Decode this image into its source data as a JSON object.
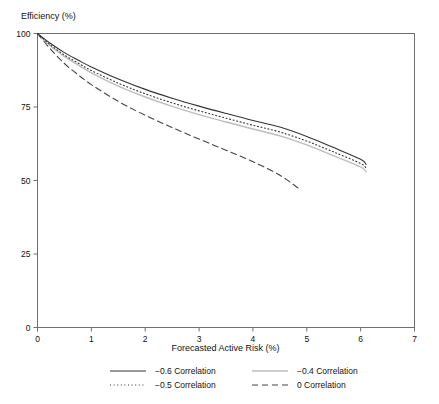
{
  "chart_data": {
    "type": "line",
    "title": "",
    "ylabel": "Efficiency (%)",
    "xlabel": "Forecasted Active Risk (%)",
    "xlim": [
      0,
      7
    ],
    "ylim": [
      0,
      100
    ],
    "xticks": [
      "0",
      "1",
      "2",
      "3",
      "4",
      "5",
      "6",
      "7"
    ],
    "yticks": [
      "0",
      "25",
      "50",
      "75",
      "100"
    ],
    "grid": false,
    "legend_position": "bottom",
    "series": [
      {
        "name": "-0.6 Correlation",
        "legend_label": "−0.6 Correlation",
        "style": "solid",
        "color": "#333333",
        "width": 1.1,
        "dash": "none",
        "x": [
          0,
          0.25,
          0.5,
          0.75,
          1,
          1.5,
          2,
          2.5,
          3,
          3.5,
          4,
          4.5,
          5,
          5.5,
          6,
          6.1
        ],
        "y": [
          100,
          96.5,
          93.5,
          91,
          88.6,
          84.5,
          81,
          78,
          75.3,
          72.8,
          70.4,
          68.2,
          65,
          61.2,
          57.2,
          55.5
        ]
      },
      {
        "name": "-0.5 Correlation",
        "legend_label": "−0.5 Correlation",
        "style": "dotted",
        "color": "#333333",
        "width": 1.1,
        "dash": "1,2.6",
        "x": [
          0,
          0.25,
          0.5,
          0.75,
          1,
          1.5,
          2,
          2.5,
          3,
          3.5,
          4,
          4.5,
          5,
          5.5,
          6,
          6.1
        ],
        "y": [
          100,
          96,
          92.7,
          90,
          87.4,
          83.1,
          79.5,
          76.4,
          73.7,
          71.2,
          68.8,
          66.5,
          63.4,
          59.7,
          55.8,
          54.2
        ]
      },
      {
        "name": "-0.4 Correlation",
        "legend_label": "−0.4 Correlation",
        "style": "solid-light",
        "color": "#bdbdbd",
        "width": 1.4,
        "dash": "none",
        "x": [
          0,
          0.25,
          0.5,
          0.75,
          1,
          1.5,
          2,
          2.5,
          3,
          3.5,
          4,
          4.5,
          5,
          5.5,
          6,
          6.1
        ],
        "y": [
          100,
          95.6,
          92.2,
          89.3,
          86.6,
          82.1,
          78.4,
          75.2,
          72.4,
          69.9,
          67.5,
          65.2,
          62.1,
          58.4,
          54.6,
          53.0
        ]
      },
      {
        "name": "0 Correlation",
        "legend_label": "0 Correlation",
        "style": "dashed",
        "color": "#444444",
        "width": 1.1,
        "dash": "6,4",
        "x": [
          0,
          0.25,
          0.5,
          0.75,
          1,
          1.5,
          2,
          2.5,
          3,
          3.5,
          4,
          4.5,
          4.85
        ],
        "y": [
          100,
          94.5,
          89.8,
          86,
          82.6,
          76.9,
          72.2,
          68,
          64.1,
          60.3,
          56.4,
          51.8,
          47.3
        ]
      }
    ]
  },
  "colors": {
    "frame": "#6f6f6f",
    "text": "#111111",
    "background": "#ffffff"
  }
}
